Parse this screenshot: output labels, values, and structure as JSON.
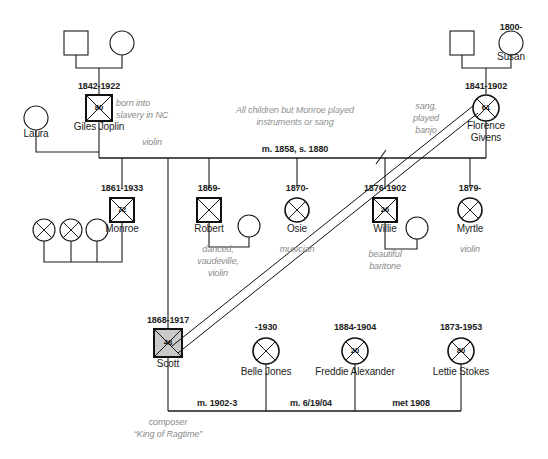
{
  "diagram": {
    "colors": {
      "line": "#1a1a1a",
      "text": "#1c1c1c",
      "note": "#8a8a8a",
      "shaded_fill": "#c9c9c9"
    }
  },
  "generation1": {
    "paternal_father": {
      "symbol": "square",
      "label": ""
    },
    "paternal_mother": {
      "symbol": "circle",
      "label": ""
    },
    "maternal_father": {
      "symbol": "square",
      "label": ""
    },
    "maternal_mother": {
      "symbol": "circle",
      "label": "Susan",
      "dates": "1800-"
    }
  },
  "generation2": {
    "giles": {
      "name": "Giles Joplin",
      "dates": "1842-1922",
      "age": "80",
      "symbol": "square-deceased",
      "note": "born into\nslavery in NC",
      "note2": "violin"
    },
    "laura": {
      "name": "Laura",
      "symbol": "circle"
    },
    "florence": {
      "name": "Florence\nGivens",
      "dates": "1841-1902",
      "age": "61",
      "symbol": "circle-deceased",
      "note": "sang,\nplayed\nbanjo"
    },
    "marriage": "m. 1858, s. 1880",
    "center_note": "All children but Monroe played\ninstruments or sang"
  },
  "generation3": [
    {
      "name": "Monroe",
      "dates": "1861-1933",
      "age": "72",
      "symbol": "square-deceased",
      "note": ""
    },
    {
      "name": "Robert",
      "dates": "1869-",
      "age": "",
      "symbol": "square-deceased",
      "note": "danced,\nvaudeville,\nviolin",
      "spouse": {
        "symbol": "circle",
        "name": ""
      }
    },
    {
      "name": "Osie",
      "dates": "1870-",
      "age": "",
      "symbol": "circle-deceased",
      "note": "musician"
    },
    {
      "name": "Willie",
      "dates": "1876-1902",
      "age": "26",
      "symbol": "square-deceased",
      "note": "beautiful\nbaritone",
      "spouse": {
        "symbol": "circle",
        "name": ""
      }
    },
    {
      "name": "Myrtle",
      "dates": "1879-",
      "age": "",
      "symbol": "circle-deceased",
      "note": "violin"
    }
  ],
  "monroe_children": [
    {
      "symbol": "circle-deceased"
    },
    {
      "symbol": "circle-deceased"
    },
    {
      "symbol": "circle"
    }
  ],
  "generation4": {
    "scott": {
      "name": "Scott",
      "dates": "1868-1917",
      "age": "48",
      "symbol": "square-deceased-shaded",
      "note": "composer\n“King of Ragtime”"
    },
    "wives": [
      {
        "name": "Belle Jones",
        "dates": "-1930",
        "age": "",
        "symbol": "circle-deceased",
        "marriage": "m. 1902-3"
      },
      {
        "name": "Freddie Alexander",
        "dates": "1884-1904",
        "age": "20",
        "symbol": "circle-deceased",
        "marriage": "m. 6/19/04"
      },
      {
        "name": "Lettie Stokes",
        "dates": "1873-1953",
        "age": "80",
        "symbol": "circle-deceased",
        "marriage": "met 1908"
      }
    ]
  }
}
